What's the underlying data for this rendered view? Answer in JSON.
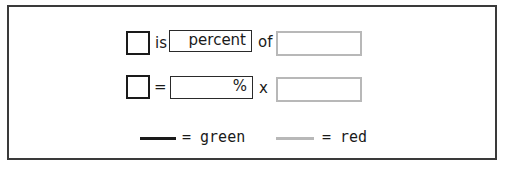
{
  "row1": {
    "connector1": "is",
    "percent_box_text": "percent",
    "connector2": "of"
  },
  "row2": {
    "connector1": "=",
    "percent_box_text": "%",
    "connector2": "x"
  },
  "legend": {
    "items": [
      {
        "line_color": "#1a1a1a",
        "label": "= green"
      },
      {
        "line_color": "#b8b8b8",
        "label": "= red"
      }
    ]
  },
  "colors": {
    "black_line": "#1a1a1a",
    "gray_line": "#b8b8b8",
    "frame": "#3a3a3a"
  }
}
